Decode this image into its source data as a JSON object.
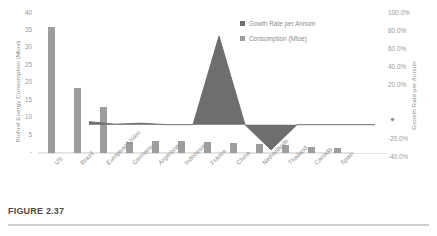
{
  "figure": {
    "caption": "FIGURE 2.37"
  },
  "legend": {
    "position": "top-right",
    "items": [
      {
        "label": "Gowth Rate per Annum",
        "color": "#6e6e6e",
        "swatch": "square"
      },
      {
        "label": "Consumption (Mtoe)",
        "color": "#9d9d9d",
        "swatch": "square"
      }
    ]
  },
  "axes": {
    "left_title": "Biofuel Energy Consumption (Mtoe)",
    "right_title": "Growth Rate per Annum",
    "left_ticks": [
      "40",
      "35",
      "30",
      "25",
      "20",
      "15",
      "10",
      "5",
      "-"
    ],
    "right_ticks": [
      "100.0%",
      "80.0%",
      "60.0%",
      "40.0%",
      "20.0%",
      "-",
      "-20.0%",
      "-40.0%"
    ]
  },
  "chart_data": {
    "type": "bar",
    "title": "",
    "xlabel": "",
    "ylabel": "Biofuel Energy Consumption (Mtoe)",
    "y2label": "Growth Rate per Annum",
    "grid": false,
    "legend_position": "top-right",
    "categories": [
      "US",
      "Brazil",
      "European Union",
      "Germany",
      "Argentina",
      "Indonesia",
      "France",
      "China",
      "Netherlands",
      "Thailand",
      "Canada",
      "Spain"
    ],
    "ylim": [
      0,
      40
    ],
    "y2lim": [
      -40,
      100
    ],
    "series": [
      {
        "name": "Consumption (Mtoe)",
        "type": "bar",
        "axis": "left",
        "color": "#9d9d9d",
        "values": [
          35.7,
          18.4,
          13.0,
          3.2,
          3.3,
          3.3,
          3.1,
          2.9,
          2.5,
          2.2,
          1.7,
          1.5
        ]
      },
      {
        "name": "Gowth Rate per Annum",
        "type": "area",
        "axis": "right",
        "color": "#6e6e6e",
        "values": [
          3.0,
          0.5,
          1.5,
          0.0,
          0.0,
          88.0,
          0.0,
          -25.0,
          0.0,
          0.0,
          0.0,
          0.0
        ]
      }
    ]
  }
}
